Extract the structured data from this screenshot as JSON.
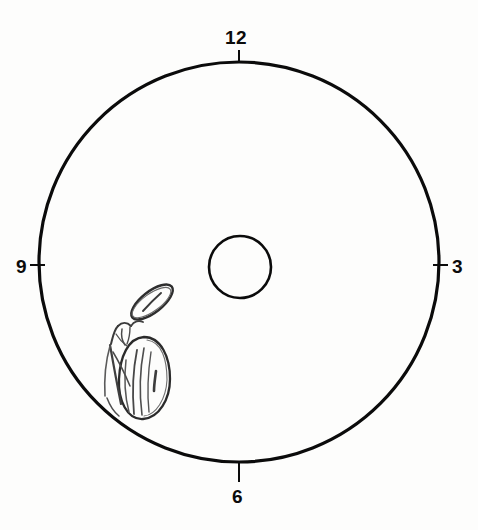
{
  "figure": {
    "type": "diagram",
    "background_color": "#fdfdfc",
    "ink_color": "#0b0b0b",
    "pencil_color": "#3c3c3c"
  },
  "outer_circle": {
    "name": "outer-circle",
    "center_x": 239,
    "center_y": 262,
    "radius": 200,
    "stroke_width": 3.2,
    "color": "#0b0b0b"
  },
  "center_circle": {
    "name": "center-circle",
    "center_x": 240,
    "center_y": 267,
    "radius": 31,
    "stroke_width": 2.6,
    "color": "#0b0b0b"
  },
  "clock_positions": [
    {
      "label": "12",
      "position": "top",
      "angle_deg": 0,
      "tick": {
        "x1": 239,
        "y1": 50,
        "x2": 239,
        "y2": 62
      }
    },
    {
      "label": "3",
      "position": "right",
      "angle_deg": 90,
      "tick": {
        "x1": 434,
        "y1": 265,
        "x2": 448,
        "y2": 265
      }
    },
    {
      "label": "6",
      "position": "bottom",
      "angle_deg": 180,
      "tick": {
        "x1": 239,
        "y1": 462,
        "x2": 239,
        "y2": 482
      }
    },
    {
      "label": "9",
      "position": "left",
      "angle_deg": 270,
      "tick": {
        "x1": 30,
        "y1": 265,
        "x2": 44,
        "y2": 265
      }
    }
  ],
  "annotation": {
    "name": "hand-drawn-lesion-sketch",
    "description": "Pencil sketch in the lower-left quadrant: a small tilted ellipse above a larger elongated ellipse with internal striations and branching stem-like lines",
    "quadrant": "lower-left",
    "approx_bounds": {
      "x": 100,
      "y": 278,
      "width": 82,
      "height": 138
    },
    "parts": [
      {
        "name": "upper-ellipse",
        "cx": 152,
        "cy": 302,
        "rx": 24,
        "ry": 10,
        "rotation_deg": -38
      },
      {
        "name": "lower-ellipse",
        "cx": 145,
        "cy": 378,
        "rx": 24,
        "ry": 41,
        "rotation_deg": -12
      },
      {
        "name": "branching-stems",
        "anchor_x": 118,
        "anchor_y": 335
      }
    ]
  }
}
